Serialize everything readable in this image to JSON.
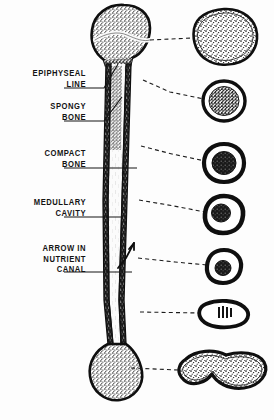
{
  "figure": {
    "background_color": "#fdfdfd",
    "ink_color": "#141414"
  },
  "labels": [
    {
      "id": "epiphyseal-line",
      "text": "EPIPHYSEAL\nLINE",
      "x": 8,
      "y": 68,
      "width": 78
    },
    {
      "id": "spongy-bone",
      "text": "SPONGY\nBONE",
      "x": 8,
      "y": 101,
      "width": 78
    },
    {
      "id": "compact-bone",
      "text": "COMPACT\nBONE",
      "x": 8,
      "y": 148,
      "width": 78
    },
    {
      "id": "medullary-cavity",
      "text": "MEDULLARY\nCAVITY",
      "x": 8,
      "y": 197,
      "width": 78
    },
    {
      "id": "arrow-in-nutrient-canal",
      "text": "ARROW IN\nNUTRIENT\nCANAL",
      "x": 8,
      "y": 243,
      "width": 78
    }
  ],
  "leader_lines": [
    {
      "id": "leader-epiphyseal-line",
      "points": "64,88 104,88 118,64"
    },
    {
      "id": "leader-spongy-bone",
      "points": "64,121 104,121 123,96"
    },
    {
      "id": "leader-compact-bone",
      "points": "64,168 137,168"
    },
    {
      "id": "leader-medullary-cavity",
      "points": "64,217 122,217"
    },
    {
      "id": "leader-nutrient-canal",
      "points": "64,272 133,272"
    }
  ],
  "cross_sections": [
    {
      "id": "cross-section-1-proximal-epiphysis",
      "cx": 224,
      "cy": 36,
      "rx": 32,
      "ry": 27,
      "fill": "spongy",
      "cortex": 2.5,
      "dash_from": [
        150,
        40
      ],
      "dash_to": [
        192,
        38
      ]
    },
    {
      "id": "cross-section-2-metaphysis",
      "cx": 224,
      "cy": 101,
      "rx": 20,
      "ry": 19,
      "fill": "spongy-dense",
      "cortex": 3.5,
      "dash_from": [
        143,
        80
      ],
      "dash_to": [
        204,
        98
      ]
    },
    {
      "id": "cross-section-3-upper-diaphysis",
      "cx": 224,
      "cy": 163,
      "rx": 19,
      "ry": 18,
      "fill": "marrow-dark",
      "cortex": 4.5,
      "dash_from": [
        141,
        146
      ],
      "dash_to": [
        205,
        160
      ]
    },
    {
      "id": "cross-section-4-mid-diaphysis",
      "cx": 224,
      "cy": 214,
      "rx": 19,
      "ry": 18,
      "fill": "marrow-dark-small",
      "cortex": 5.5,
      "dash_from": [
        139,
        200
      ],
      "dash_to": [
        205,
        211
      ]
    },
    {
      "id": "cross-section-5-lower-diaphysis",
      "cx": 224,
      "cy": 266,
      "rx": 17,
      "ry": 16,
      "fill": "marrow-dark-small",
      "cortex": 5,
      "dash_from": [
        138,
        258
      ],
      "dash_to": [
        207,
        264
      ]
    },
    {
      "id": "cross-section-6-distal-metaphysis",
      "cx": 224,
      "cy": 314,
      "rx": 24,
      "ry": 15,
      "fill": "marrow-streak",
      "cortex": 4.5,
      "dash_from": [
        140,
        312
      ],
      "dash_to": [
        200,
        313
      ]
    },
    {
      "id": "cross-section-7-distal-epiphysis",
      "cx": 222,
      "cy": 372,
      "rx": 44,
      "ry": 18,
      "fill": "spongy",
      "cortex": 3.5,
      "dash_from": [
        131,
        368
      ],
      "dash_to": [
        178,
        370
      ]
    }
  ],
  "bone": {
    "id": "long-bone-longitudinal-section",
    "parts": [
      "proximal-epiphysis",
      "epiphyseal-line",
      "spongy-bone",
      "compact-bone-cortex",
      "medullary-cavity",
      "nutrient-canal-arrow",
      "distal-epiphysis"
    ]
  }
}
